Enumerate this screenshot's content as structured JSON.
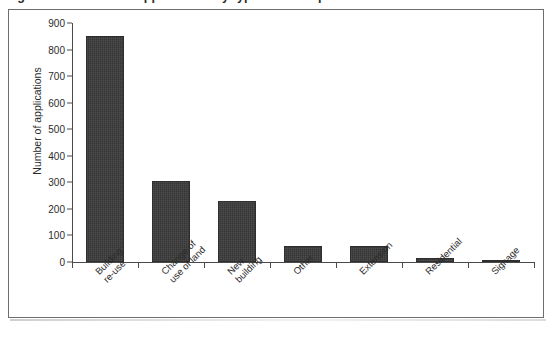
{
  "caption": {
    "text": "Figure 3.4 Number of applications by type of development"
  },
  "chart_data": {
    "type": "bar",
    "title": "",
    "xlabel": "",
    "ylabel": "Number of applications",
    "ylim": [
      0,
      900
    ],
    "ytick_step": 100,
    "yticks": [
      "900",
      "800",
      "700",
      "600",
      "500",
      "400",
      "300",
      "200",
      "100",
      "0"
    ],
    "grid": false,
    "legend": "none",
    "bar_color": "#3a3a3a",
    "categories": [
      "Building re-use",
      "Change of use of land",
      "New building",
      "Other",
      "Extension",
      "Residential",
      "Signage"
    ],
    "category_lines": [
      [
        "Building",
        "re-use"
      ],
      [
        "Change of",
        "use of land"
      ],
      [
        "New",
        "building"
      ],
      [
        "Other"
      ],
      [
        "Extension"
      ],
      [
        "Residential"
      ],
      [
        "Signage"
      ]
    ],
    "values": [
      850,
      305,
      230,
      62,
      60,
      16,
      5
    ]
  }
}
